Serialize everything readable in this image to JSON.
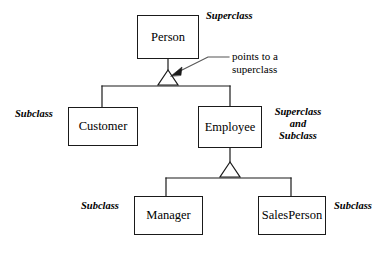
{
  "diagram": {
    "type": "uml-class-hierarchy",
    "colors": {
      "background": "#ffffff",
      "stroke": "#1a1a1a",
      "text": "#000000"
    },
    "nodes": [
      {
        "id": "person",
        "label": "Person",
        "role": "Superclass"
      },
      {
        "id": "customer",
        "label": "Customer",
        "role": "Subclass"
      },
      {
        "id": "employee",
        "label": "Employee",
        "role": "Superclass and Subclass"
      },
      {
        "id": "manager",
        "label": "Manager",
        "role": "Subclass"
      },
      {
        "id": "salesperson",
        "label": "SalesPerson",
        "role": "Subclass"
      }
    ],
    "edges": [
      {
        "from": "customer",
        "to": "person",
        "kind": "generalization"
      },
      {
        "from": "employee",
        "to": "person",
        "kind": "generalization"
      },
      {
        "from": "manager",
        "to": "employee",
        "kind": "generalization"
      },
      {
        "from": "salesperson",
        "to": "employee",
        "kind": "generalization"
      }
    ],
    "annotations": {
      "superclass_top": "Superclass",
      "subclass_customer": "Subclass",
      "superclass_and_subclass_line1": "Superclass",
      "superclass_and_subclass_line2": "and",
      "superclass_and_subclass_line3": "Subclass",
      "subclass_manager": "Subclass",
      "subclass_salesperson": "Subclass"
    },
    "callout": {
      "line1": "points to a",
      "line2": "superclass",
      "target": "generalization-triangle-person"
    }
  }
}
